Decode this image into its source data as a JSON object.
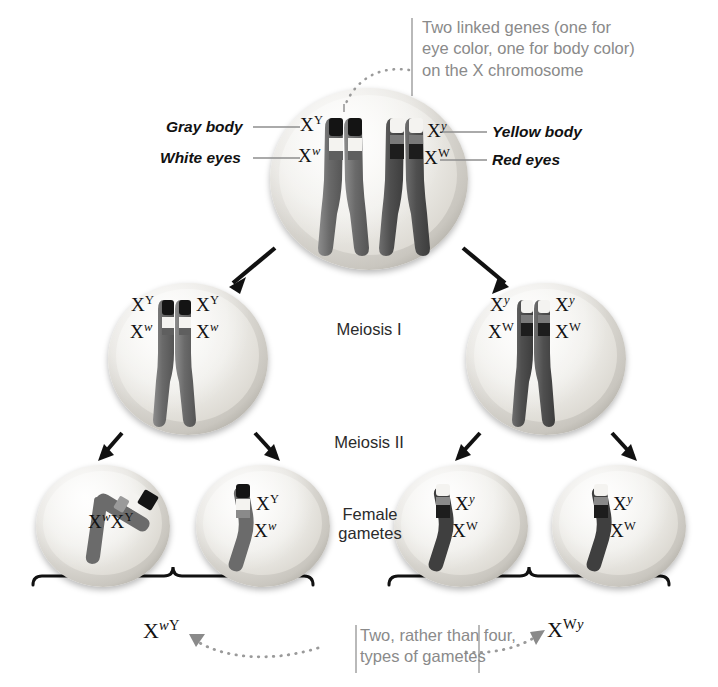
{
  "figure": {
    "top_note": {
      "line1": "Two linked genes (one for",
      "line2": "eye color, one for body color)",
      "line3": "on the X chromosome"
    },
    "bottom_note": {
      "line1": "Two, rather than four,",
      "line2": "types of gametes"
    },
    "stage_labels": {
      "meiosis_1": "Meiosis I",
      "meiosis_2": "Meiosis II",
      "gametes_line1": "Female",
      "gametes_line2": "gametes"
    }
  },
  "phenotypes": {
    "left_top": "Gray body",
    "left_bottom": "White eyes",
    "right_top": "Yellow body",
    "right_bottom": "Red eyes"
  },
  "alleles": {
    "gray_body": {
      "symbol": "X",
      "sup": "Y",
      "sup_italic": false
    },
    "white_eyes": {
      "symbol": "X",
      "sup": "w",
      "sup_italic": true
    },
    "yellow_body": {
      "symbol": "X",
      "sup": "y",
      "sup_italic": true
    },
    "red_eyes": {
      "symbol": "X",
      "sup": "W",
      "sup_italic": false
    }
  },
  "parent_cell": {
    "left_chromatid_labels": {
      "top": "X",
      "top_sup": "Y",
      "bottom": "X",
      "bottom_sup": "w"
    },
    "right_chromatid_labels": {
      "top": "X",
      "top_sup": "y",
      "bottom": "X",
      "bottom_sup": "W"
    }
  },
  "meiosis1_cells": [
    {
      "name": "left",
      "labels": [
        {
          "symbol": "X",
          "sup": "Y",
          "sup_italic": false
        },
        {
          "symbol": "X",
          "sup": "Y",
          "sup_italic": false
        },
        {
          "symbol": "X",
          "sup": "w",
          "sup_italic": true
        },
        {
          "symbol": "X",
          "sup": "w",
          "sup_italic": true
        }
      ]
    },
    {
      "name": "right",
      "labels": [
        {
          "symbol": "X",
          "sup": "y",
          "sup_italic": true
        },
        {
          "symbol": "X",
          "sup": "y",
          "sup_italic": true
        },
        {
          "symbol": "X",
          "sup": "W",
          "sup_italic": false
        },
        {
          "symbol": "X",
          "sup": "W",
          "sup_italic": false
        }
      ]
    }
  ],
  "gametes": [
    {
      "name": "gamete-1",
      "layout": "inline",
      "labels": [
        {
          "symbol": "X",
          "sup": "w",
          "sup_italic": true
        },
        {
          "symbol": "X",
          "sup": "Y",
          "sup_italic": false
        }
      ]
    },
    {
      "name": "gamete-2",
      "layout": "stacked",
      "labels": [
        {
          "symbol": "X",
          "sup": "Y",
          "sup_italic": false
        },
        {
          "symbol": "X",
          "sup": "w",
          "sup_italic": true
        }
      ]
    },
    {
      "name": "gamete-3",
      "layout": "stacked",
      "labels": [
        {
          "symbol": "X",
          "sup": "y",
          "sup_italic": true
        },
        {
          "symbol": "X",
          "sup": "W",
          "sup_italic": false
        }
      ]
    },
    {
      "name": "gamete-4",
      "layout": "stacked",
      "labels": [
        {
          "symbol": "X",
          "sup": "y",
          "sup_italic": true
        },
        {
          "symbol": "X",
          "sup": "W",
          "sup_italic": false
        }
      ]
    }
  ],
  "gamete_types": {
    "left": {
      "symbol": "X",
      "sup_italic": "w",
      "sup_upright": "Y"
    },
    "right": {
      "symbol": "X",
      "sup_upright": "W",
      "sup_italic": "y"
    }
  },
  "colors": {
    "band_dark": "#141414",
    "band_white": "#f5f4f1",
    "band_mid": "#6f6f6f",
    "chromosome_body": "#707070",
    "chromosome_body_dark": "#4a4a4a",
    "cell_rim": "#a5a29a",
    "cell_fill": "#efeeea",
    "note_text": "#8a8a8a",
    "arrow": "#111111",
    "leader_line": "#9a9a9a",
    "dotted_guide": "#9a9a9a"
  }
}
